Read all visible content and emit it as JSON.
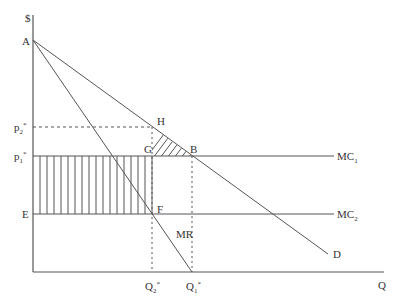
{
  "diagram": {
    "type": "monopoly-price-discrimination-cost-change",
    "axes": {
      "y_label": "$",
      "x_label": "Q"
    },
    "points": {
      "A": "A",
      "H": "H",
      "G": "G",
      "B": "B",
      "F": "F",
      "E": "E"
    },
    "curves": {
      "mc1": {
        "base": "MC",
        "sub": "1"
      },
      "mc2": {
        "base": "MC",
        "sub": "2"
      },
      "mr": "MR",
      "demand": "D"
    },
    "price_labels": {
      "p2": {
        "base": "p",
        "sub": "2",
        "sup": "*"
      },
      "p1": {
        "base": "p",
        "sub": "1",
        "sup": "*"
      }
    },
    "quantity_labels": {
      "q2": {
        "base": "Q",
        "sub": "2",
        "sup": "*"
      },
      "q1": {
        "base": "Q",
        "sub": "1",
        "sup": "*"
      }
    },
    "colors": {
      "line": "#555555",
      "text": "#333333",
      "background": "#ffffff"
    }
  }
}
